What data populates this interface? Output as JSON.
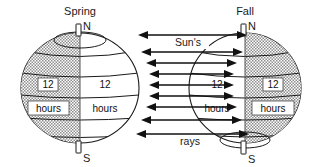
{
  "diagram": {
    "background_color": "#ffffff",
    "line_color": "#1a1a1a",
    "shade_color": "#b8b8b8",
    "globes": [
      {
        "id": "spring",
        "season_label": "Spring",
        "north_pole_label": "N",
        "south_pole_label": "S",
        "shaded_side": "left",
        "center_x": 80,
        "center_y": 88,
        "radius_x": 59,
        "radius_y": 55,
        "day_night_labels": [
          {
            "number": "12",
            "unit": "hours",
            "side": "left",
            "boxed": true
          },
          {
            "number": "12",
            "unit": "hours",
            "side": "right",
            "boxed": false
          }
        ]
      },
      {
        "id": "fall",
        "season_label": "Fall",
        "north_pole_label": "N",
        "south_pole_label": "S",
        "shaded_side": "right",
        "center_x": 245,
        "center_y": 88,
        "radius_x": 56,
        "radius_y": 55,
        "day_night_labels": [
          {
            "number": "12",
            "unit": "hours",
            "side": "left",
            "boxed": false
          },
          {
            "number": "12",
            "unit": "hours",
            "side": "right",
            "boxed": true
          }
        ]
      }
    ],
    "rays": {
      "top_label": "Sun's",
      "bottom_label": "rays",
      "arrow_count": 9,
      "direction": "double-headed horizontal",
      "color": "#111111"
    }
  }
}
